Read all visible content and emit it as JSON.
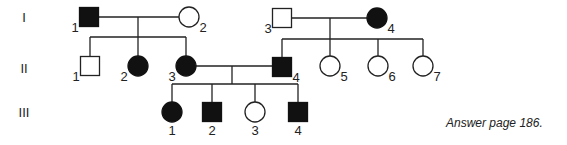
{
  "generations": [
    {
      "label": "I",
      "y": 17
    },
    {
      "label": "II",
      "y": 68
    },
    {
      "label": "III",
      "y": 112
    }
  ],
  "individuals": [
    {
      "id": "I-1",
      "num": "1",
      "sex": "male",
      "affected": true,
      "cx": 89,
      "cy": 17,
      "label_pos": "bl"
    },
    {
      "id": "I-2",
      "num": "2",
      "sex": "female",
      "affected": false,
      "cx": 189,
      "cy": 17,
      "label_pos": "br"
    },
    {
      "id": "I-3",
      "num": "3",
      "sex": "male",
      "affected": false,
      "cx": 282,
      "cy": 18,
      "label_pos": "bl"
    },
    {
      "id": "I-4",
      "num": "4",
      "sex": "female",
      "affected": true,
      "cx": 377,
      "cy": 18,
      "label_pos": "br"
    },
    {
      "id": "II-1",
      "num": "1",
      "sex": "male",
      "affected": false,
      "cx": 90,
      "cy": 66,
      "label_pos": "bl"
    },
    {
      "id": "II-2",
      "num": "2",
      "sex": "female",
      "affected": true,
      "cx": 138,
      "cy": 66,
      "label_pos": "bl"
    },
    {
      "id": "II-3",
      "num": "3",
      "sex": "female",
      "affected": true,
      "cx": 186,
      "cy": 66,
      "label_pos": "bl"
    },
    {
      "id": "II-4",
      "num": "4",
      "sex": "male",
      "affected": true,
      "cx": 282,
      "cy": 67,
      "label_pos": "br"
    },
    {
      "id": "II-5",
      "num": "5",
      "sex": "female",
      "affected": false,
      "cx": 330,
      "cy": 66,
      "label_pos": "br"
    },
    {
      "id": "II-6",
      "num": "6",
      "sex": "female",
      "affected": false,
      "cx": 378,
      "cy": 66,
      "label_pos": "br"
    },
    {
      "id": "II-7",
      "num": "7",
      "sex": "female",
      "affected": false,
      "cx": 423,
      "cy": 66,
      "label_pos": "br"
    },
    {
      "id": "III-1",
      "num": "1",
      "sex": "female",
      "affected": true,
      "cx": 172,
      "cy": 112,
      "label_pos": "b"
    },
    {
      "id": "III-2",
      "num": "2",
      "sex": "male",
      "affected": true,
      "cx": 212,
      "cy": 112,
      "label_pos": "b"
    },
    {
      "id": "III-3",
      "num": "3",
      "sex": "female",
      "affected": false,
      "cx": 255,
      "cy": 112,
      "label_pos": "b"
    },
    {
      "id": "III-4",
      "num": "4",
      "sex": "male",
      "affected": true,
      "cx": 298,
      "cy": 112,
      "label_pos": "b"
    }
  ],
  "colors": {
    "affected": "#111111",
    "unaffected": "#ffffff",
    "line": "#222222"
  },
  "note": "Answer page 186."
}
